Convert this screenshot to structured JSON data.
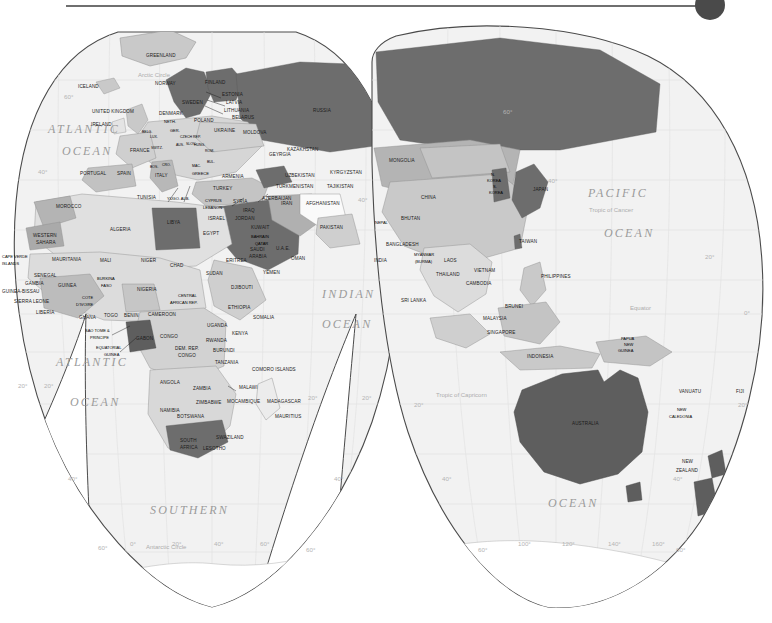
{
  "header": {
    "rule_name": "horizontal-rule",
    "knob_name": "circle-marker",
    "rule_color": "#6f6f6f",
    "knob_color": "#4a4a4a"
  },
  "map": {
    "title": "World Map",
    "projection": "interrupted-gore",
    "palette": {
      "background": "#ffffff",
      "ocean_fill": "#f2f2f2",
      "land_light": "#e4e4e4",
      "land_mid": "#c9c9c9",
      "land_dark": "#6d6d6d",
      "land_white": "#fafafa",
      "outline": "#4a4a4a",
      "border": "#8f8f8f",
      "label_text": "#1b1b1b",
      "ocean_text": "#9b9b9b",
      "graticule_text": "#b4b4b4"
    },
    "oceans": [
      {
        "id": "atlantic-north",
        "line1": "ATLANTIC",
        "line2": "OCEAN"
      },
      {
        "id": "atlantic-south",
        "line1": "ATLANTIC",
        "line2": "OCEAN"
      },
      {
        "id": "indian",
        "line1": "INDIAN",
        "line2": "OCEAN"
      },
      {
        "id": "pacific",
        "line1": "PACIFIC",
        "line2": "OCEAN"
      },
      {
        "id": "southern",
        "line1": "SOUTHERN",
        "line2": "OCEAN"
      }
    ],
    "geo_lines": [
      {
        "id": "arctic-circle",
        "label": "Arctic Circle"
      },
      {
        "id": "tropic-of-cancer",
        "label": "Tropic of Cancer"
      },
      {
        "id": "equator",
        "label": "Equator"
      },
      {
        "id": "tropic-of-capricorn",
        "label": "Tropic of Capricorn"
      },
      {
        "id": "antarctic-circle",
        "label": "Antarctic Circle"
      }
    ],
    "graticule_labels": {
      "latitudes_left": [
        "60°",
        "40°",
        "20°",
        "20°",
        "40°",
        "60°"
      ],
      "latitudes_right": [
        "60°",
        "40°",
        "20°",
        "0°",
        "20°",
        "40°",
        "60°"
      ],
      "longitudes_bottom_left": [
        "0°",
        "20°",
        "40°",
        "60°"
      ],
      "longitudes_bottom_right": [
        "100°",
        "120°",
        "140°",
        "160°"
      ]
    },
    "labels": [
      {
        "t": "GREENLAND",
        "x": 146,
        "y": 35,
        "cls": "lbl"
      },
      {
        "t": "ICELAND",
        "x": 78,
        "y": 66,
        "cls": "lbl"
      },
      {
        "t": "NORWAY",
        "x": 155,
        "y": 63,
        "cls": "lbl"
      },
      {
        "t": "FINLAND",
        "x": 205,
        "y": 62,
        "cls": "lbl"
      },
      {
        "t": "SWEDEN",
        "x": 182,
        "y": 82,
        "cls": "lbl"
      },
      {
        "t": "ESTONIA",
        "x": 222,
        "y": 74,
        "cls": "lbl"
      },
      {
        "t": "LATVIA",
        "x": 226,
        "y": 82,
        "cls": "lbl"
      },
      {
        "t": "LITHUANIA",
        "x": 224,
        "y": 90,
        "cls": "lbl"
      },
      {
        "t": "BELARUS",
        "x": 232,
        "y": 97,
        "cls": "lbl"
      },
      {
        "t": "DENMARK",
        "x": 159,
        "y": 93,
        "cls": "lbl"
      },
      {
        "t": "UNITED KINGDOM",
        "x": 92,
        "y": 91,
        "cls": "lbl"
      },
      {
        "t": "IRELAND",
        "x": 91,
        "y": 104,
        "cls": "lbl"
      },
      {
        "t": "NETH.",
        "x": 164,
        "y": 101,
        "cls": "lbl-sm"
      },
      {
        "t": "POLAND",
        "x": 194,
        "y": 100,
        "cls": "lbl"
      },
      {
        "t": "BELG.",
        "x": 142,
        "y": 111,
        "cls": "lbl-xs"
      },
      {
        "t": "GER.",
        "x": 170,
        "y": 110,
        "cls": "lbl-sm"
      },
      {
        "t": "CZECH REP.",
        "x": 180,
        "y": 116,
        "cls": "lbl-xs"
      },
      {
        "t": "UKRAINE",
        "x": 214,
        "y": 110,
        "cls": "lbl"
      },
      {
        "t": "MOLDOVA",
        "x": 243,
        "y": 112,
        "cls": "lbl"
      },
      {
        "t": "LUX.",
        "x": 150,
        "y": 116,
        "cls": "lbl-xs"
      },
      {
        "t": "SWITZ.",
        "x": 151,
        "y": 127,
        "cls": "lbl-xs"
      },
      {
        "t": "AUS.",
        "x": 176,
        "y": 124,
        "cls": "lbl-xs"
      },
      {
        "t": "SLOV.",
        "x": 186,
        "y": 123,
        "cls": "lbl-xs"
      },
      {
        "t": "HUNG.",
        "x": 194,
        "y": 124,
        "cls": "lbl-xs"
      },
      {
        "t": "FRANCE",
        "x": 130,
        "y": 130,
        "cls": "lbl"
      },
      {
        "t": "ROM.",
        "x": 205,
        "y": 130,
        "cls": "lbl-xs"
      },
      {
        "t": "BUL.",
        "x": 207,
        "y": 141,
        "cls": "lbl-xs"
      },
      {
        "t": "GEYRGIA",
        "x": 269,
        "y": 134,
        "cls": "lbl"
      },
      {
        "t": "PORTUGAL",
        "x": 80,
        "y": 153,
        "cls": "lbl"
      },
      {
        "t": "SPAIN",
        "x": 117,
        "y": 153,
        "cls": "lbl"
      },
      {
        "t": "BOS.",
        "x": 150,
        "y": 146,
        "cls": "lbl-xs"
      },
      {
        "t": "CRO.",
        "x": 162,
        "y": 144,
        "cls": "lbl-xs"
      },
      {
        "t": "MAC.",
        "x": 192,
        "y": 145,
        "cls": "lbl-xs"
      },
      {
        "t": "ITALY",
        "x": 155,
        "y": 155,
        "cls": "lbl"
      },
      {
        "t": "GREECE",
        "x": 192,
        "y": 153,
        "cls": "lbl-sm"
      },
      {
        "t": "ARMENIA",
        "x": 222,
        "y": 156,
        "cls": "lbl"
      },
      {
        "t": "TURKEY",
        "x": 213,
        "y": 168,
        "cls": "lbl"
      },
      {
        "t": "TURKMENISTAN",
        "x": 276,
        "y": 166,
        "cls": "lbl"
      },
      {
        "t": "UZBEKISTAN",
        "x": 285,
        "y": 155,
        "cls": "lbl"
      },
      {
        "t": "KYRGYZSTAN",
        "x": 330,
        "y": 152,
        "cls": "lbl"
      },
      {
        "t": "TAJIKISTAN",
        "x": 327,
        "y": 166,
        "cls": "lbl"
      },
      {
        "t": "AZERBAIJAN",
        "x": 262,
        "y": 178,
        "cls": "lbl"
      },
      {
        "t": "TUNISIA",
        "x": 137,
        "y": 177,
        "cls": "lbl"
      },
      {
        "t": "YUGO. ALB.",
        "x": 167,
        "y": 178,
        "cls": "lbl-sm"
      },
      {
        "t": "CYPRUS",
        "x": 205,
        "y": 180,
        "cls": "lbl-sm"
      },
      {
        "t": "LEBANON",
        "x": 203,
        "y": 187,
        "cls": "lbl-sm"
      },
      {
        "t": "SYRIA",
        "x": 233,
        "y": 181,
        "cls": "lbl"
      },
      {
        "t": "IRAQ",
        "x": 243,
        "y": 190,
        "cls": "lbl"
      },
      {
        "t": "IRAN",
        "x": 281,
        "y": 183,
        "cls": "lbl"
      },
      {
        "t": "AFGHANISTAN",
        "x": 306,
        "y": 183,
        "cls": "lbl"
      },
      {
        "t": "ISRAEL",
        "x": 208,
        "y": 198,
        "cls": "lbl"
      },
      {
        "t": "JORDAN",
        "x": 235,
        "y": 198,
        "cls": "lbl"
      },
      {
        "t": "MOROCCO",
        "x": 56,
        "y": 186,
        "cls": "lbl"
      },
      {
        "t": "ALGERIA",
        "x": 110,
        "y": 209,
        "cls": "lbl"
      },
      {
        "t": "LIBYA",
        "x": 167,
        "y": 202,
        "cls": "lbl"
      },
      {
        "t": "EGYPT",
        "x": 203,
        "y": 213,
        "cls": "lbl"
      },
      {
        "t": "KUWAIT",
        "x": 251,
        "y": 207,
        "cls": "lbl"
      },
      {
        "t": "BAHRAIN",
        "x": 251,
        "y": 216,
        "cls": "lbl-sm"
      },
      {
        "t": "QATAR",
        "x": 255,
        "y": 223,
        "cls": "lbl-sm"
      },
      {
        "t": "U.A.E.",
        "x": 276,
        "y": 228,
        "cls": "lbl"
      },
      {
        "t": "PAKISTAN",
        "x": 320,
        "y": 207,
        "cls": "lbl"
      },
      {
        "t": "NEPAL",
        "x": 375,
        "y": 202,
        "cls": "lbl-sm"
      },
      {
        "t": "BHUTAN",
        "x": 401,
        "y": 198,
        "cls": "lbl"
      },
      {
        "t": "BANGLADESH",
        "x": 386,
        "y": 224,
        "cls": "lbl"
      },
      {
        "t": "WESTERN",
        "x": 33,
        "y": 215,
        "cls": "lbl"
      },
      {
        "t": "SAHARA",
        "x": 36,
        "y": 222,
        "cls": "lbl"
      },
      {
        "t": "CAPE VERDE",
        "x": 2,
        "y": 236,
        "cls": "lbl-sm"
      },
      {
        "t": "ISLANDS",
        "x": 2,
        "y": 243,
        "cls": "lbl-sm"
      },
      {
        "t": "MAURITANIA",
        "x": 52,
        "y": 239,
        "cls": "lbl"
      },
      {
        "t": "MALI",
        "x": 100,
        "y": 240,
        "cls": "lbl"
      },
      {
        "t": "NIGER",
        "x": 141,
        "y": 240,
        "cls": "lbl"
      },
      {
        "t": "CHAD",
        "x": 170,
        "y": 245,
        "cls": "lbl"
      },
      {
        "t": "SUDAN",
        "x": 206,
        "y": 253,
        "cls": "lbl"
      },
      {
        "t": "ERITREA",
        "x": 226,
        "y": 240,
        "cls": "lbl"
      },
      {
        "t": "YEMEN",
        "x": 263,
        "y": 252,
        "cls": "lbl"
      },
      {
        "t": "SAUDI",
        "x": 250,
        "y": 229,
        "cls": "lbl"
      },
      {
        "t": "ARABIA",
        "x": 249,
        "y": 236,
        "cls": "lbl"
      },
      {
        "t": "OMAN",
        "x": 291,
        "y": 238,
        "cls": "lbl"
      },
      {
        "t": "INDIA",
        "x": 374,
        "y": 240,
        "cls": "lbl"
      },
      {
        "t": "MYANMAR",
        "x": 414,
        "y": 234,
        "cls": "lbl-sm"
      },
      {
        "t": "(BURMA)",
        "x": 415,
        "y": 241,
        "cls": "lbl-sm"
      },
      {
        "t": "LAOS",
        "x": 444,
        "y": 240,
        "cls": "lbl"
      },
      {
        "t": "VIETNAM",
        "x": 474,
        "y": 250,
        "cls": "lbl"
      },
      {
        "t": "THAILAND",
        "x": 436,
        "y": 254,
        "cls": "lbl"
      },
      {
        "t": "CAMBODIA",
        "x": 466,
        "y": 263,
        "cls": "lbl"
      },
      {
        "t": "SENEGAL",
        "x": 34,
        "y": 255,
        "cls": "lbl"
      },
      {
        "t": "GAMBIA",
        "x": 25,
        "y": 263,
        "cls": "lbl"
      },
      {
        "t": "GUINEA",
        "x": 58,
        "y": 265,
        "cls": "lbl"
      },
      {
        "t": "GUINEA-BISSAU",
        "x": 2,
        "y": 271,
        "cls": "lbl"
      },
      {
        "t": "BURKINA",
        "x": 97,
        "y": 258,
        "cls": "lbl-sm"
      },
      {
        "t": "FASO",
        "x": 101,
        "y": 265,
        "cls": "lbl-sm"
      },
      {
        "t": "SIERRA LEONE",
        "x": 14,
        "y": 281,
        "cls": "lbl"
      },
      {
        "t": "COTE",
        "x": 82,
        "y": 277,
        "cls": "lbl-sm"
      },
      {
        "t": "D'IVOIRE",
        "x": 76,
        "y": 284,
        "cls": "lbl-sm"
      },
      {
        "t": "NIGERIA",
        "x": 137,
        "y": 269,
        "cls": "lbl"
      },
      {
        "t": "CENTRAL",
        "x": 178,
        "y": 275,
        "cls": "lbl-sm"
      },
      {
        "t": "AFRICAN REP.",
        "x": 170,
        "y": 282,
        "cls": "lbl-sm"
      },
      {
        "t": "ETHIOPIA",
        "x": 228,
        "y": 287,
        "cls": "lbl"
      },
      {
        "t": "DJIBOUTI",
        "x": 231,
        "y": 267,
        "cls": "lbl"
      },
      {
        "t": "SRI LANKA",
        "x": 401,
        "y": 280,
        "cls": "lbl"
      },
      {
        "t": "LIBERIA",
        "x": 36,
        "y": 292,
        "cls": "lbl"
      },
      {
        "t": "GHANA",
        "x": 79,
        "y": 297,
        "cls": "lbl"
      },
      {
        "t": "TOGO",
        "x": 104,
        "y": 295,
        "cls": "lbl"
      },
      {
        "t": "BENIN",
        "x": 124,
        "y": 295,
        "cls": "lbl"
      },
      {
        "t": "CAMEROON",
        "x": 148,
        "y": 294,
        "cls": "lbl"
      },
      {
        "t": "SAO TOME &",
        "x": 85,
        "y": 310,
        "cls": "lbl-sm"
      },
      {
        "t": "PRINCIPE",
        "x": 90,
        "y": 317,
        "cls": "lbl-sm"
      },
      {
        "t": "EQUATORIAL",
        "x": 96,
        "y": 327,
        "cls": "lbl-sm"
      },
      {
        "t": "GUINEA",
        "x": 104,
        "y": 334,
        "cls": "lbl-sm"
      },
      {
        "t": "GABON",
        "x": 136,
        "y": 318,
        "cls": "lbl"
      },
      {
        "t": "CONGO",
        "x": 160,
        "y": 316,
        "cls": "lbl"
      },
      {
        "t": "DEM. REP.",
        "x": 175,
        "y": 328,
        "cls": "lbl"
      },
      {
        "t": "CONGO",
        "x": 178,
        "y": 335,
        "cls": "lbl"
      },
      {
        "t": "UGANDA",
        "x": 207,
        "y": 305,
        "cls": "lbl"
      },
      {
        "t": "KENYA",
        "x": 232,
        "y": 313,
        "cls": "lbl"
      },
      {
        "t": "SOMALIA",
        "x": 253,
        "y": 297,
        "cls": "lbl"
      },
      {
        "t": "RWANDA",
        "x": 206,
        "y": 320,
        "cls": "lbl"
      },
      {
        "t": "BURUNDI",
        "x": 213,
        "y": 330,
        "cls": "lbl"
      },
      {
        "t": "TANZANIA",
        "x": 215,
        "y": 342,
        "cls": "lbl"
      },
      {
        "t": "ANGOLA",
        "x": 160,
        "y": 362,
        "cls": "lbl"
      },
      {
        "t": "ZAMBIA",
        "x": 193,
        "y": 368,
        "cls": "lbl"
      },
      {
        "t": "MALAWI",
        "x": 239,
        "y": 367,
        "cls": "lbl"
      },
      {
        "t": "COMORO ISLANDS",
        "x": 252,
        "y": 349,
        "cls": "lbl"
      },
      {
        "t": "MADAGASCAR",
        "x": 267,
        "y": 381,
        "cls": "lbl"
      },
      {
        "t": "MOCAMBIQUE",
        "x": 227,
        "y": 381,
        "cls": "lbl"
      },
      {
        "t": "ZIMBABWE",
        "x": 196,
        "y": 382,
        "cls": "lbl"
      },
      {
        "t": "NAMIBIA",
        "x": 160,
        "y": 390,
        "cls": "lbl"
      },
      {
        "t": "BOTSWANA",
        "x": 177,
        "y": 396,
        "cls": "lbl"
      },
      {
        "t": "MAURITIUS",
        "x": 275,
        "y": 396,
        "cls": "lbl"
      },
      {
        "t": "SWAZILAND",
        "x": 216,
        "y": 417,
        "cls": "lbl"
      },
      {
        "t": "SOUTH",
        "x": 180,
        "y": 420,
        "cls": "lbl"
      },
      {
        "t": "AFRICA",
        "x": 180,
        "y": 427,
        "cls": "lbl"
      },
      {
        "t": "LESOTHO",
        "x": 203,
        "y": 428,
        "cls": "lbl"
      },
      {
        "t": "RUSSIA",
        "x": 313,
        "y": 90,
        "cls": "lbl"
      },
      {
        "t": "KAZAKHSTAN",
        "x": 287,
        "y": 129,
        "cls": "lbl"
      },
      {
        "t": "MONGOLIA",
        "x": 389,
        "y": 140,
        "cls": "lbl"
      },
      {
        "t": "CHINA",
        "x": 421,
        "y": 177,
        "cls": "lbl"
      },
      {
        "t": "N.",
        "x": 491,
        "y": 154,
        "cls": "lbl-sm"
      },
      {
        "t": "KOREA",
        "x": 487,
        "y": 160,
        "cls": "lbl-sm"
      },
      {
        "t": "S.",
        "x": 493,
        "y": 166,
        "cls": "lbl-sm"
      },
      {
        "t": "KOREA",
        "x": 489,
        "y": 172,
        "cls": "lbl-sm"
      },
      {
        "t": "JAPAN",
        "x": 533,
        "y": 169,
        "cls": "lbl"
      },
      {
        "t": "TAIWAN",
        "x": 519,
        "y": 221,
        "cls": "lbl"
      },
      {
        "t": "PHILIPPINES",
        "x": 541,
        "y": 256,
        "cls": "lbl"
      },
      {
        "t": "BRUNEI",
        "x": 505,
        "y": 286,
        "cls": "lbl"
      },
      {
        "t": "MALAYSIA",
        "x": 483,
        "y": 298,
        "cls": "lbl"
      },
      {
        "t": "SINGAPORE",
        "x": 487,
        "y": 312,
        "cls": "lbl"
      },
      {
        "t": "INDONESIA",
        "x": 527,
        "y": 336,
        "cls": "lbl"
      },
      {
        "t": "PAPUA",
        "x": 621,
        "y": 318,
        "cls": "lbl-sm"
      },
      {
        "t": "NEW",
        "x": 624,
        "y": 324,
        "cls": "lbl-sm"
      },
      {
        "t": "GUINEA",
        "x": 618,
        "y": 330,
        "cls": "lbl-sm"
      },
      {
        "t": "AUSTRALIA",
        "x": 572,
        "y": 403,
        "cls": "lbl"
      },
      {
        "t": "VANUATU",
        "x": 679,
        "y": 371,
        "cls": "lbl"
      },
      {
        "t": "FIJI",
        "x": 736,
        "y": 371,
        "cls": "lbl"
      },
      {
        "t": "NEW",
        "x": 677,
        "y": 389,
        "cls": "lbl-sm"
      },
      {
        "t": "CALEDONIA",
        "x": 669,
        "y": 396,
        "cls": "lbl-sm"
      },
      {
        "t": "NEW",
        "x": 682,
        "y": 441,
        "cls": "lbl"
      },
      {
        "t": "ZEALAND",
        "x": 676,
        "y": 450,
        "cls": "lbl"
      }
    ]
  }
}
